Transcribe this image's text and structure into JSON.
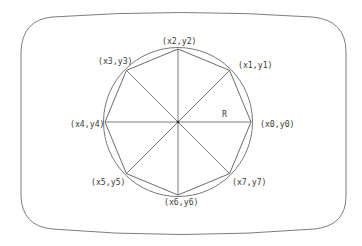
{
  "diagram": {
    "radius_label": "R",
    "center": {
      "x": 178,
      "y": 122
    },
    "radius": 73,
    "vertices": [
      {
        "id": 0,
        "label": "(x0,y0)",
        "angle_deg": 0
      },
      {
        "id": 1,
        "label": "(x1,y1)",
        "angle_deg": 45
      },
      {
        "id": 2,
        "label": "(x2,y2)",
        "angle_deg": 90
      },
      {
        "id": 3,
        "label": "(x3,y3)",
        "angle_deg": 135
      },
      {
        "id": 4,
        "label": "(x4,y4)",
        "angle_deg": 180
      },
      {
        "id": 5,
        "label": "(x5,y5)",
        "angle_deg": 225
      },
      {
        "id": 6,
        "label": "(x6,y6)",
        "angle_deg": 270
      },
      {
        "id": 7,
        "label": "(x7,y7)",
        "angle_deg": 315
      }
    ],
    "colors": {
      "stroke": "#5a5a5a",
      "text": "#3a3a3a",
      "background": "#ffffff"
    }
  }
}
